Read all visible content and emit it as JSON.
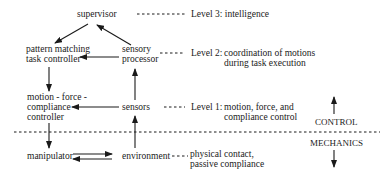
{
  "nodes": {
    "supervisor": "supervisor",
    "pattern_matching": [
      "pattern matching",
      "task controller"
    ],
    "sensory_processor": [
      "sensory",
      "processor"
    ],
    "motion_controller": [
      "motion -  force -",
      "compliance",
      "controller"
    ],
    "sensors": "sensors",
    "manipulator": "manipulator",
    "environment": "environment"
  },
  "levels": {
    "level3": {
      "label": "Level 3:",
      "desc": [
        "intelligence"
      ]
    },
    "level2": {
      "label": "Level 2:",
      "desc": [
        "coordination of motions",
        "during task execution"
      ]
    },
    "level1": {
      "label": "Level 1:",
      "desc": [
        "motion, force,  and",
        "compliance control"
      ]
    },
    "mechanics_note": [
      "physical contact,",
      "passive compliance"
    ]
  },
  "regions": {
    "control": "CONTROL",
    "mechanics": "MECHANICS"
  },
  "colors": {
    "ink": "#1a1a1a",
    "background": "#ffffff"
  }
}
